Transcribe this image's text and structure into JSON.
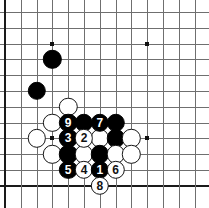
{
  "diagram": {
    "board": {
      "type": "go-board",
      "grid_cols": 13,
      "grid_rows": 12,
      "origin_x": 5,
      "origin_y": 12,
      "pitch": 15.8,
      "line_color": "#6f6f6f",
      "edge_color": "#1a1a1a",
      "background_color": "#ffffff",
      "edges": {
        "left": true,
        "bottom": true,
        "top": false,
        "right": false
      }
    },
    "star_points": [
      {
        "col": 3,
        "row": 2
      },
      {
        "col": 9,
        "row": 2
      },
      {
        "col": 3,
        "row": 8
      },
      {
        "col": 9,
        "row": 8
      }
    ],
    "stone_colors": {
      "black": "#000000",
      "white": "#ffffff",
      "outline": "#141414"
    },
    "stone_radius": 9.2,
    "stones": [
      {
        "col": 3,
        "row": 3,
        "color": "black",
        "label": ""
      },
      {
        "col": 2,
        "row": 5,
        "color": "black",
        "label": ""
      },
      {
        "col": 4,
        "row": 6,
        "color": "white",
        "label": ""
      },
      {
        "col": 3,
        "row": 7,
        "color": "white",
        "label": ""
      },
      {
        "col": 4,
        "row": 7,
        "color": "black",
        "label": "9"
      },
      {
        "col": 5,
        "row": 7,
        "color": "black",
        "label": ""
      },
      {
        "col": 6,
        "row": 7,
        "color": "black",
        "label": "7"
      },
      {
        "col": 7,
        "row": 7,
        "color": "black",
        "label": ""
      },
      {
        "col": 2,
        "row": 8,
        "color": "white",
        "label": ""
      },
      {
        "col": 4,
        "row": 8,
        "color": "black",
        "label": "3"
      },
      {
        "col": 5,
        "row": 8,
        "color": "white",
        "label": "2"
      },
      {
        "col": 6,
        "row": 8,
        "color": "white",
        "label": ""
      },
      {
        "col": 7,
        "row": 8,
        "color": "black",
        "label": ""
      },
      {
        "col": 8,
        "row": 8,
        "color": "white",
        "label": ""
      },
      {
        "col": 3,
        "row": 9,
        "color": "white",
        "label": ""
      },
      {
        "col": 4,
        "row": 9,
        "color": "black",
        "label": ""
      },
      {
        "col": 5,
        "row": 9,
        "color": "white",
        "label": ""
      },
      {
        "col": 6,
        "row": 9,
        "color": "black",
        "label": ""
      },
      {
        "col": 7,
        "row": 9,
        "color": "white",
        "label": ""
      },
      {
        "col": 8,
        "row": 9,
        "color": "white",
        "label": ""
      },
      {
        "col": 4,
        "row": 10,
        "color": "black",
        "label": "5"
      },
      {
        "col": 5,
        "row": 10,
        "color": "white",
        "label": "4"
      },
      {
        "col": 6,
        "row": 10,
        "color": "black",
        "label": "1"
      },
      {
        "col": 7,
        "row": 10,
        "color": "white",
        "label": "6"
      },
      {
        "col": 6,
        "row": 11,
        "color": "white",
        "label": "8"
      }
    ],
    "move_sequence": [
      {
        "number": "1",
        "color": "black"
      },
      {
        "number": "2",
        "color": "white"
      },
      {
        "number": "3",
        "color": "black"
      },
      {
        "number": "4",
        "color": "white"
      },
      {
        "number": "5",
        "color": "black"
      },
      {
        "number": "6",
        "color": "white"
      },
      {
        "number": "7",
        "color": "black"
      },
      {
        "number": "8",
        "color": "white"
      },
      {
        "number": "9",
        "color": "black"
      }
    ]
  }
}
